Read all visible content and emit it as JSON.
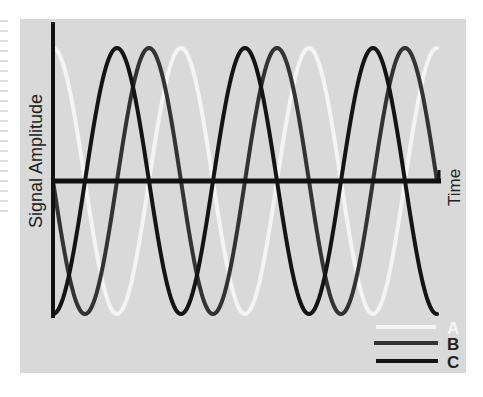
{
  "chart_data": {
    "type": "line",
    "title": "",
    "xlabel": "Time",
    "ylabel": "Signal Amplitude",
    "grid": false,
    "legend_position": "bottom-right",
    "x": [
      0,
      0.125,
      0.25,
      0.375,
      0.5,
      0.625,
      0.75,
      0.875,
      1.0,
      1.125,
      1.25,
      1.375,
      1.5,
      1.625,
      1.75,
      1.875,
      2.0,
      2.125,
      2.25,
      2.375,
      2.5,
      2.625,
      2.75,
      2.875,
      3.0
    ],
    "x_unit": "cycles",
    "ylim": [
      -1,
      1
    ],
    "xlim": [
      0,
      3
    ],
    "series": [
      {
        "name": "A",
        "color": "#f4f4f4",
        "phase_deg": 0,
        "form": "cos",
        "values": [
          1,
          0.71,
          0,
          -0.71,
          -1,
          -0.71,
          0,
          0.71,
          1,
          0.71,
          0,
          -0.71,
          -1,
          -0.71,
          0,
          0.71,
          1,
          0.71,
          0,
          -0.71,
          -1,
          -0.71,
          0,
          0.71,
          1
        ]
      },
      {
        "name": "B",
        "color": "#333333",
        "phase_deg": 90,
        "form": "-sin",
        "values": [
          0,
          -0.71,
          -1,
          -0.71,
          0,
          0.71,
          1,
          0.71,
          0,
          -0.71,
          -1,
          -0.71,
          0,
          0.71,
          1,
          0.71,
          0,
          -0.71,
          -1,
          -0.71,
          0,
          0.71,
          1,
          0.71,
          0
        ]
      },
      {
        "name": "C",
        "color": "#141414",
        "phase_deg": 180,
        "form": "-cos",
        "values": [
          -1,
          -0.71,
          0,
          0.71,
          1,
          0.71,
          0,
          -0.71,
          -1,
          -0.71,
          0,
          0.71,
          1,
          0.71,
          0,
          -0.71,
          -1,
          -0.71,
          0,
          0.71,
          1,
          0.71,
          0,
          -0.71,
          -1
        ]
      }
    ],
    "annotations": []
  },
  "layout": {
    "panel_color": "#d9d9d9",
    "axis_color": "#111111"
  }
}
